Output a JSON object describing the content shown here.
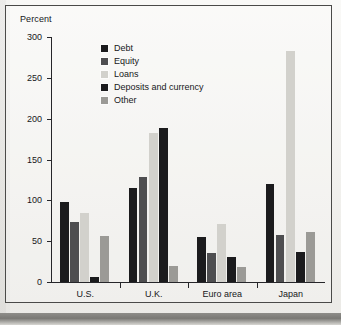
{
  "figure": {
    "y_axis_title": "Percent"
  },
  "legend": {
    "items": [
      {
        "label": "Debt",
        "color": "#1b1b1d"
      },
      {
        "label": "Equity",
        "color": "#4e4e50"
      },
      {
        "label": "Loans",
        "color": "#d2d1cc"
      },
      {
        "label": "Deposits and currency",
        "color": "#1b1b1d"
      },
      {
        "label": "Other",
        "color": "#9b9a96"
      }
    ]
  },
  "chart_data": {
    "type": "bar",
    "title": "",
    "xlabel": "",
    "ylabel": "Percent",
    "ylim": [
      0,
      300
    ],
    "yticks": [
      0,
      50,
      100,
      150,
      200,
      250,
      300
    ],
    "ytick_labels": [
      "0",
      "50",
      "100",
      "150",
      "200",
      "250",
      "300"
    ],
    "grid": false,
    "legend_position": "upper-left-inside",
    "categories": [
      "U.S.",
      "U.K.",
      "Euro area",
      "Japan"
    ],
    "series": [
      {
        "name": "Debt",
        "color": "#1b1b1d",
        "values": [
          98,
          115,
          55,
          120
        ]
      },
      {
        "name": "Equity",
        "color": "#4e4e50",
        "values": [
          74,
          129,
          36,
          58
        ]
      },
      {
        "name": "Loans",
        "color": "#d2d1cc",
        "values": [
          84,
          183,
          71,
          283
        ]
      },
      {
        "name": "Deposits and currency",
        "color": "#1b1b1d",
        "values": [
          6,
          189,
          31,
          37
        ]
      },
      {
        "name": "Other",
        "color": "#9b9a96",
        "values": [
          56,
          20,
          18,
          61
        ]
      }
    ]
  }
}
